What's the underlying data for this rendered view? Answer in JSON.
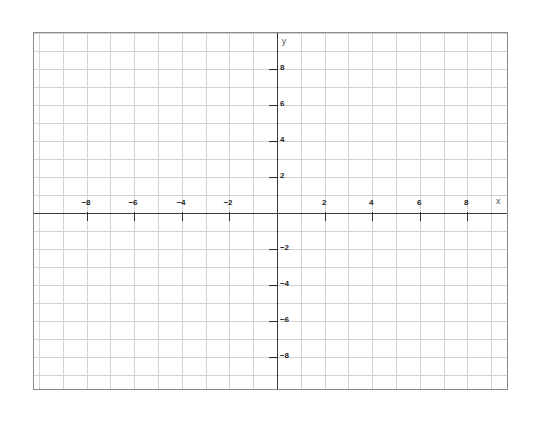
{
  "figure": {
    "title": "",
    "background_color": "#ffffff",
    "frame": {
      "left": 33,
      "top": 32,
      "width": 475,
      "height": 358,
      "border_color": "#8a8a8a"
    }
  },
  "chart_data": {
    "type": "scatter",
    "title": "",
    "subtitle": "",
    "xlabel": "x",
    "ylabel": "y",
    "xlim": [
      -10.125,
      9.667
    ],
    "ylim": [
      -9.889,
      10.0
    ],
    "x_major_ticks": [
      -8,
      -6,
      -4,
      -2,
      2,
      4,
      6,
      8
    ],
    "y_major_ticks": [
      8,
      6,
      4,
      2,
      -2,
      -4,
      -6,
      -8
    ],
    "x_tick_labels": [
      "−8",
      "−6",
      "−4",
      "−2",
      "2",
      "4",
      "6",
      "8"
    ],
    "y_tick_labels": [
      "8",
      "6",
      "4",
      "2",
      "−2",
      "−4",
      "−6",
      "−8"
    ],
    "x_minor_step": 1,
    "y_minor_step": 1,
    "grid": true,
    "grid_color": "#d2d2d2",
    "axis_color": "#3a3a3a",
    "tick_color": "#2b2b2b",
    "label_color": "#1c1c1c",
    "axis_name_color": "#55565a",
    "legend": null,
    "series": [],
    "values": [],
    "categories": [],
    "annotations": []
  },
  "geometry": {
    "origin_x_px": 276,
    "origin_y_px": 212,
    "px_per_unit_x": 23.8,
    "px_per_unit_y": 18.0
  },
  "axis_labels": {
    "y_axis_name": "y",
    "x_axis_name": "x"
  }
}
